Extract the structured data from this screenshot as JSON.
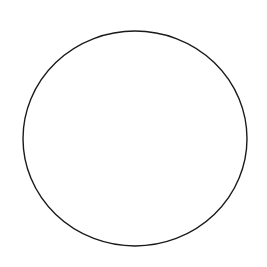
{
  "canvas": {
    "width": 267,
    "height": 267,
    "background": "#ffffff"
  },
  "shapes": [
    {
      "type": "ellipse",
      "cx": 135,
      "cy": 138.5,
      "rx": 112,
      "ry": 107.5,
      "stroke": "#1a1a1a",
      "stroke_width": 1.4,
      "fill": "none"
    }
  ]
}
